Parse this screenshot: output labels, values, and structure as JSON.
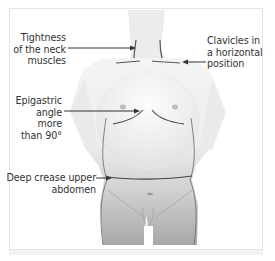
{
  "figure": {
    "labels": {
      "neck": [
        "Tightness",
        "of the neck",
        "muscles"
      ],
      "clavicles": [
        "Clavicles in",
        "a horizontal",
        "position"
      ],
      "epigastric": [
        "Epigastric",
        "angle more",
        "than 90°"
      ],
      "crease": [
        "Deep crease upper",
        "abdomen"
      ]
    }
  },
  "colors": {
    "text": "#333333",
    "line": "#444444",
    "frame": "#e6e6e6",
    "body_light": "#f2f2f2",
    "body_dark": "#a9a9a9"
  }
}
